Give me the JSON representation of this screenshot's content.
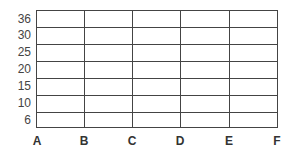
{
  "grid": {
    "y_labels": [
      "36",
      "30",
      "25",
      "20",
      "15",
      "10",
      "6"
    ],
    "x_labels": [
      "A",
      "B",
      "C",
      "D",
      "E",
      "F"
    ],
    "line_color": "#444444"
  }
}
